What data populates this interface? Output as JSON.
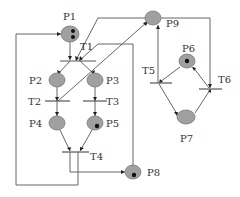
{
  "diagram": {
    "type": "petri-net",
    "colors": {
      "place_fill": "#a0a0a0",
      "edge": "#666666",
      "token": "#111111",
      "background": "#ffffff"
    },
    "places": [
      {
        "id": "P1",
        "label": "P1",
        "tokens": 2
      },
      {
        "id": "P2",
        "label": "P2",
        "tokens": 0
      },
      {
        "id": "P3",
        "label": "P3",
        "tokens": 0
      },
      {
        "id": "P4",
        "label": "P4",
        "tokens": 0
      },
      {
        "id": "P5",
        "label": "P5",
        "tokens": 1
      },
      {
        "id": "P6",
        "label": "P6",
        "tokens": 1
      },
      {
        "id": "P7",
        "label": "P7",
        "tokens": 0
      },
      {
        "id": "P8",
        "label": "P8",
        "tokens": 1
      },
      {
        "id": "P9",
        "label": "P9",
        "tokens": 0
      }
    ],
    "transitions": [
      {
        "id": "T1",
        "label": "T1"
      },
      {
        "id": "T2",
        "label": "T2"
      },
      {
        "id": "T3",
        "label": "T3"
      },
      {
        "id": "T4",
        "label": "T4"
      },
      {
        "id": "T5",
        "label": "T5"
      },
      {
        "id": "T6",
        "label": "T6"
      }
    ],
    "arcs": [
      {
        "from": "P1",
        "to": "T1"
      },
      {
        "from": "P9",
        "to": "T1"
      },
      {
        "from": "P8",
        "to": "T1"
      },
      {
        "from": "T1",
        "to": "P2"
      },
      {
        "from": "T1",
        "to": "P3"
      },
      {
        "from": "P2",
        "to": "T2"
      },
      {
        "from": "P3",
        "to": "T3"
      },
      {
        "from": "T2",
        "to": "P4"
      },
      {
        "from": "T2",
        "to": "P9"
      },
      {
        "from": "T3",
        "to": "P5"
      },
      {
        "from": "P4",
        "to": "T4"
      },
      {
        "from": "P5",
        "to": "T4"
      },
      {
        "from": "T4",
        "to": "P8"
      },
      {
        "from": "T4",
        "to": "P1"
      },
      {
        "from": "P9",
        "to": "T6"
      },
      {
        "from": "T5",
        "to": "P9"
      },
      {
        "from": "P6",
        "to": "T5"
      },
      {
        "from": "T6",
        "to": "P6"
      },
      {
        "from": "T5",
        "to": "P7"
      },
      {
        "from": "P7",
        "to": "T6"
      }
    ]
  }
}
